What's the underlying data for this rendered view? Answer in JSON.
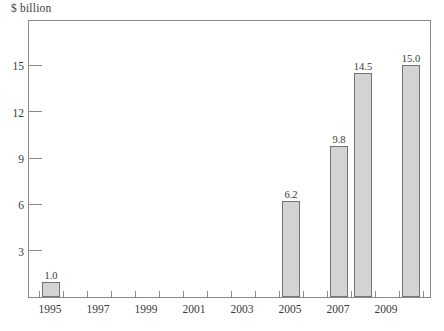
{
  "colors": {
    "text": "#3a3a3a",
    "line": "#8a8a8a",
    "bar_fill": "#d3d3d3",
    "bar_border": "#737373",
    "background": "#ffffff"
  },
  "chart_data": {
    "type": "bar",
    "title": "",
    "ylabel": "$ billion",
    "xlabel": "",
    "x": [
      1995,
      2005,
      2007,
      2008,
      2010
    ],
    "values": [
      1.0,
      6.2,
      9.8,
      14.5,
      15.0
    ],
    "bar_labels": [
      "1.0",
      "6.2",
      "9.8",
      "14.5",
      "15.0"
    ],
    "x_axis": {
      "first_year": 1995,
      "last_year": 2010,
      "tick_labels": [
        "1995",
        "1997",
        "1999",
        "2001",
        "2003",
        "2005",
        "2007",
        "2009"
      ],
      "minor_tick_interval_years": 1
    },
    "y_axis": {
      "min": 0,
      "max": 18,
      "tick_values": [
        3,
        6,
        9,
        12,
        15
      ]
    },
    "grid": false,
    "legend": false
  }
}
